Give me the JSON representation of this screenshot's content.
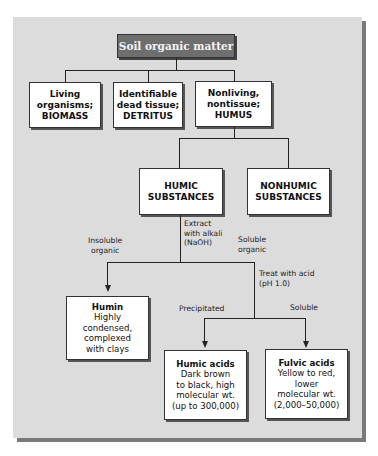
{
  "title": "Soil organic matter",
  "level1": [
    {
      "line1": "Living",
      "line2": "organisms;",
      "line3": "BIOMASS"
    },
    {
      "line1": "Identifiable",
      "line2": "dead tissue;",
      "line3": "DETRITUS"
    },
    {
      "line1": "Nonliving,",
      "line2": "nontissue;",
      "line3": "HUMUS"
    }
  ],
  "level2": [
    {
      "line1": "HUMIC",
      "line2": "SUBSTANCES"
    },
    {
      "line1": "NONHUMIC",
      "line2": "SUBSTANCES"
    }
  ],
  "labels": {
    "extract": [
      "Extract",
      "with alkali",
      "(NaOH)"
    ],
    "insoluble": [
      "Insoluble",
      "organic"
    ],
    "soluble": [
      "Soluble",
      "organic"
    ],
    "treat": [
      "Treat with acid",
      "(pH 1.0)"
    ],
    "precipitated": "Precipitated",
    "soluble2": "Soluble"
  },
  "leaves": {
    "humin": {
      "name": "Humin",
      "lines": [
        "Highly",
        "condensed,",
        "complexed",
        "with clays"
      ]
    },
    "humic_acids": {
      "name": "Humic acids",
      "lines": [
        "Dark brown",
        "to black, high",
        "molecular wt.",
        "(up to 300,000)"
      ]
    },
    "fulvic_acids": {
      "name": "Fulvic acids",
      "lines": [
        "Yellow to red,",
        "lower",
        "molecular wt.",
        "(2,000–50,000)"
      ]
    }
  }
}
